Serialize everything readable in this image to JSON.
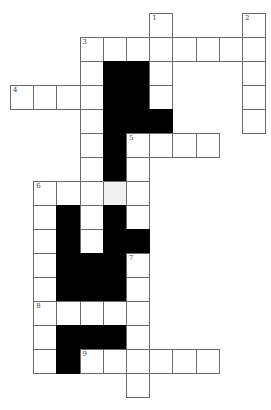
{
  "layout": {
    "origin_x": 10,
    "origin_y": 13,
    "cell_w": 23.2,
    "cell_h": 24,
    "cols": 11,
    "rows": 16
  },
  "colors": {
    "white": "#ffffff",
    "black": "#000000",
    "shade": "#f1f1f1",
    "border": "#6a6a6a"
  },
  "clues": [
    {
      "number": "1",
      "row": 0,
      "col": 6,
      "direction": "down"
    },
    {
      "number": "2",
      "row": 0,
      "col": 10,
      "direction": "down"
    },
    {
      "number": "3",
      "row": 1,
      "col": 3,
      "direction": "across/down"
    },
    {
      "number": "4",
      "row": 3,
      "col": 0,
      "direction": "across"
    },
    {
      "number": "5",
      "row": 5,
      "col": 5,
      "direction": "across/down"
    },
    {
      "number": "6",
      "row": 7,
      "col": 1,
      "direction": "across/down"
    },
    {
      "number": "7",
      "row": 10,
      "col": 5,
      "direction": "down"
    },
    {
      "number": "8",
      "row": 12,
      "col": 1,
      "direction": "across"
    },
    {
      "number": "9",
      "row": 14,
      "col": 3,
      "direction": "across"
    }
  ],
  "cells": [
    [
      0,
      6,
      "w"
    ],
    [
      0,
      10,
      "w"
    ],
    [
      1,
      3,
      "w"
    ],
    [
      1,
      4,
      "w"
    ],
    [
      1,
      5,
      "w"
    ],
    [
      1,
      6,
      "w"
    ],
    [
      1,
      7,
      "w"
    ],
    [
      1,
      8,
      "w"
    ],
    [
      1,
      9,
      "w"
    ],
    [
      1,
      10,
      "w"
    ],
    [
      2,
      3,
      "w"
    ],
    [
      2,
      4,
      "b"
    ],
    [
      2,
      5,
      "b"
    ],
    [
      2,
      6,
      "w"
    ],
    [
      2,
      10,
      "w"
    ],
    [
      3,
      0,
      "w"
    ],
    [
      3,
      1,
      "w"
    ],
    [
      3,
      2,
      "w"
    ],
    [
      3,
      3,
      "w"
    ],
    [
      3,
      4,
      "b"
    ],
    [
      3,
      5,
      "b"
    ],
    [
      3,
      6,
      "w"
    ],
    [
      3,
      10,
      "w"
    ],
    [
      4,
      3,
      "w"
    ],
    [
      4,
      4,
      "b"
    ],
    [
      4,
      5,
      "b"
    ],
    [
      4,
      6,
      "b"
    ],
    [
      4,
      10,
      "w"
    ],
    [
      5,
      3,
      "w"
    ],
    [
      5,
      4,
      "b"
    ],
    [
      5,
      5,
      "w"
    ],
    [
      5,
      6,
      "w"
    ],
    [
      5,
      7,
      "w"
    ],
    [
      5,
      8,
      "w"
    ],
    [
      6,
      3,
      "w"
    ],
    [
      6,
      4,
      "b"
    ],
    [
      6,
      5,
      "w"
    ],
    [
      7,
      1,
      "w"
    ],
    [
      7,
      2,
      "w"
    ],
    [
      7,
      3,
      "w"
    ],
    [
      7,
      4,
      "s"
    ],
    [
      7,
      5,
      "w"
    ],
    [
      8,
      1,
      "w"
    ],
    [
      8,
      2,
      "b"
    ],
    [
      8,
      3,
      "w"
    ],
    [
      8,
      4,
      "b"
    ],
    [
      8,
      5,
      "w"
    ],
    [
      9,
      1,
      "w"
    ],
    [
      9,
      2,
      "b"
    ],
    [
      9,
      3,
      "w"
    ],
    [
      9,
      4,
      "b"
    ],
    [
      9,
      5,
      "b"
    ],
    [
      10,
      1,
      "w"
    ],
    [
      10,
      2,
      "b"
    ],
    [
      10,
      3,
      "b"
    ],
    [
      10,
      4,
      "b"
    ],
    [
      10,
      5,
      "w"
    ],
    [
      11,
      1,
      "w"
    ],
    [
      11,
      2,
      "b"
    ],
    [
      11,
      3,
      "b"
    ],
    [
      11,
      4,
      "b"
    ],
    [
      11,
      5,
      "w"
    ],
    [
      12,
      1,
      "w"
    ],
    [
      12,
      2,
      "w"
    ],
    [
      12,
      3,
      "w"
    ],
    [
      12,
      4,
      "w"
    ],
    [
      12,
      5,
      "w"
    ],
    [
      13,
      1,
      "w"
    ],
    [
      13,
      2,
      "b"
    ],
    [
      13,
      3,
      "b"
    ],
    [
      13,
      4,
      "b"
    ],
    [
      13,
      5,
      "w"
    ],
    [
      14,
      1,
      "w"
    ],
    [
      14,
      2,
      "b"
    ],
    [
      14,
      3,
      "w"
    ],
    [
      14,
      4,
      "w"
    ],
    [
      14,
      5,
      "w"
    ],
    [
      14,
      6,
      "w"
    ],
    [
      14,
      7,
      "w"
    ],
    [
      14,
      8,
      "w"
    ],
    [
      15,
      5,
      "w"
    ]
  ]
}
